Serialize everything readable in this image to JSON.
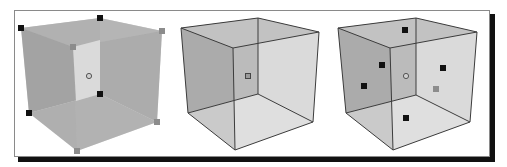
{
  "figure": {
    "panels": [
      {
        "id": "cube-selected-bounding-box",
        "description": "Translucent cube with bounding-box grip handles at corners",
        "colors": {
          "face_back": "#a9a9a9",
          "face_inner": "#d9d9d9",
          "face_side": "#b4b4b4",
          "edge": "#9a9a9a"
        },
        "handles": [
          {
            "x": 21,
            "y": 28,
            "color": "#111111"
          },
          {
            "x": 100,
            "y": 18,
            "color": "#111111"
          },
          {
            "x": 162,
            "y": 31,
            "color": "#8c8c8c"
          },
          {
            "x": 73,
            "y": 47,
            "color": "#8c8c8c"
          },
          {
            "x": 100,
            "y": 94,
            "color": "#111111"
          },
          {
            "x": 29,
            "y": 113,
            "color": "#111111"
          },
          {
            "x": 157,
            "y": 122,
            "color": "#8c8c8c"
          },
          {
            "x": 77,
            "y": 151,
            "color": "#8c8c8c"
          }
        ],
        "center_marker": {
          "x": 89,
          "y": 76
        }
      },
      {
        "id": "cube-plain",
        "description": "Translucent cube with outlined edges and center marker",
        "colors": {
          "face_left": "#b0b0b0",
          "face_right": "#dcdcdc",
          "face_top": "#c4c4c4",
          "floor": "#e2e2e2",
          "edge": "#3c3c3c"
        },
        "center_marker": {
          "x": 248,
          "y": 76
        }
      },
      {
        "id": "cube-face-handles",
        "description": "Translucent cube with a handle at the center of each face",
        "colors": {
          "face_left": "#b0b0b0",
          "face_right": "#dcdcdc",
          "face_top": "#c4c4c4",
          "floor": "#e2e2e2",
          "edge": "#3c3c3c"
        },
        "handles": [
          {
            "x": 405,
            "y": 30,
            "color": "#111111"
          },
          {
            "x": 382,
            "y": 65,
            "color": "#111111"
          },
          {
            "x": 364,
            "y": 86,
            "color": "#111111"
          },
          {
            "x": 443,
            "y": 68,
            "color": "#111111"
          },
          {
            "x": 436,
            "y": 89,
            "color": "#8c8c8c"
          },
          {
            "x": 406,
            "y": 118,
            "color": "#111111"
          }
        ],
        "center_marker": {
          "x": 406,
          "y": 76
        }
      }
    ],
    "frame": {
      "border_color": "#8a8a8a",
      "shadow_color": "#111111",
      "background": "#ffffff"
    }
  }
}
